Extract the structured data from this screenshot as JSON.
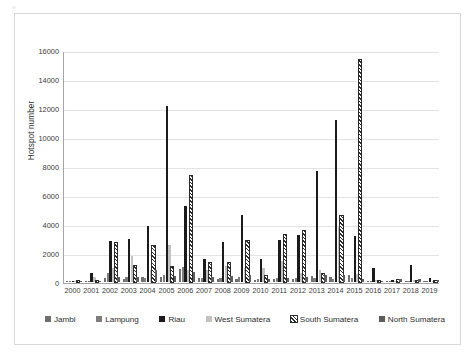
{
  "chart_data": {
    "type": "bar",
    "title": "",
    "xlabel": "",
    "ylabel": "Hotspot number",
    "ylim": [
      0,
      16000
    ],
    "ytick_step": 2000,
    "yticks": [
      "0",
      "2000",
      "4000",
      "6000",
      "8000",
      "10000",
      "12000",
      "14000",
      "16000"
    ],
    "grid": true,
    "legend_position": "bottom",
    "categories": [
      "2000",
      "2001",
      "2002",
      "2003",
      "2004",
      "2005",
      "2006",
      "2007",
      "2008",
      "2009",
      "2010",
      "2011",
      "2012",
      "2013",
      "2014",
      "2015",
      "2016",
      "2017",
      "2018",
      "2019"
    ],
    "series": [
      {
        "name": "Jambi",
        "color": "#6f6f6f",
        "pattern": "solid",
        "values": [
          15,
          30,
          250,
          180,
          330,
          330,
          900,
          250,
          220,
          240,
          170,
          230,
          230,
          400,
          330,
          450,
          60,
          40,
          60,
          35
        ]
      },
      {
        "name": "Lampung",
        "color": "#7d7d7d",
        "pattern": "solid",
        "values": [
          10,
          60,
          600,
          380,
          260,
          450,
          1050,
          300,
          300,
          330,
          240,
          300,
          290,
          250,
          240,
          290,
          45,
          35,
          50,
          30
        ]
      },
      {
        "name": "Riau",
        "color": "#1b1b1b",
        "pattern": "solid",
        "values": [
          25,
          640,
          2820,
          2960,
          3860,
          12150,
          5220,
          1600,
          2790,
          4630,
          1560,
          2900,
          3220,
          7660,
          11150,
          3160,
          1000,
          120,
          1140,
          300
        ]
      },
      {
        "name": "West Sumatera",
        "color": "#c2c2c2",
        "pattern": "solid",
        "values": [
          10,
          320,
          980,
          1800,
          800,
          2520,
          820,
          840,
          1120,
          980,
          950,
          1420,
          630,
          820,
          3760,
          520,
          170,
          100,
          160,
          60
        ]
      },
      {
        "name": "South Sumatera",
        "color": "#2b2b2b",
        "pattern": "diagonal-hatch",
        "values": [
          10,
          80,
          2700,
          1120,
          2460,
          1050,
          7290,
          1320,
          1300,
          2810,
          420,
          3250,
          3530,
          560,
          4540,
          15280,
          60,
          110,
          80,
          25
        ]
      },
      {
        "name": "North Sumatera",
        "color": "#5c5c5c",
        "pattern": "solid",
        "values": [
          15,
          40,
          380,
          330,
          800,
          420,
          680,
          380,
          420,
          500,
          240,
          260,
          330,
          450,
          480,
          230,
          70,
          180,
          200,
          110
        ]
      }
    ]
  },
  "legend": {
    "items": [
      {
        "label": "Jambi",
        "swatch": "jambi-swatch"
      },
      {
        "label": "Lampung",
        "swatch": "lampung-swatch"
      },
      {
        "label": "Riau",
        "swatch": "riau-swatch"
      },
      {
        "label": "West Sumatera",
        "swatch": "west-sumatera-swatch"
      },
      {
        "label": "South Sumatera",
        "swatch": "south-sumatera-swatch"
      },
      {
        "label": "North Sumatera",
        "swatch": "north-sumatera-swatch"
      }
    ]
  }
}
